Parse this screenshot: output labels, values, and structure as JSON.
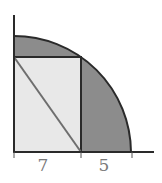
{
  "diagram": {
    "type": "geometry",
    "labels": {
      "left_segment": "7",
      "right_segment": "5"
    },
    "colors": {
      "background": "#ffffff",
      "shaded_region": "#8c8c8c",
      "rectangle_fill": "#e8e8e8",
      "stroke": "#333333",
      "diagonal": "#6e6e6e",
      "label": "#7a7a7a"
    }
  }
}
